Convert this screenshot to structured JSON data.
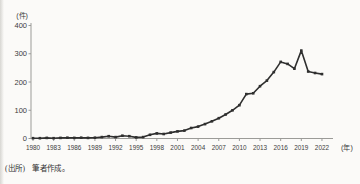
{
  "page": {
    "clipped_title": "■■■■　■■■■■■■■■■■■■■（1980～2022年）",
    "source_note": "(出所)　筆者作成。"
  },
  "chart_data": {
    "type": "line",
    "title": "",
    "xlabel": "(年)",
    "ylabel": "(件)",
    "x_start": 1980,
    "x_end": 2022,
    "x": [
      1980,
      1981,
      1982,
      1983,
      1984,
      1985,
      1986,
      1987,
      1988,
      1989,
      1990,
      1991,
      1992,
      1993,
      1994,
      1995,
      1996,
      1997,
      1998,
      1999,
      2000,
      2001,
      2002,
      2003,
      2004,
      2005,
      2006,
      2007,
      2008,
      2009,
      2010,
      2011,
      2012,
      2013,
      2014,
      2015,
      2016,
      2017,
      2018,
      2019,
      2020,
      2021,
      2022
    ],
    "values": [
      1,
      1,
      2,
      1,
      2,
      3,
      2,
      3,
      2,
      3,
      5,
      8,
      5,
      10,
      8,
      4,
      5,
      13,
      18,
      16,
      21,
      25,
      28,
      37,
      42,
      51,
      61,
      72,
      85,
      100,
      118,
      157,
      160,
      185,
      205,
      235,
      271,
      264,
      247,
      311,
      237,
      232,
      228
    ],
    "x_tick_labels": [
      "1980",
      "1983",
      "1986",
      "1989",
      "1992",
      "1995",
      "1998",
      "2001",
      "2004",
      "2007",
      "2010",
      "2013",
      "2016",
      "2019",
      "2022"
    ],
    "x_tick_step": 3,
    "y_ticks": [
      0,
      100,
      200,
      300,
      400
    ],
    "ylim": [
      0,
      400
    ],
    "grid": false,
    "legend": false,
    "line_color": "#2f2f2f",
    "marker": "square",
    "axis_color": "#9b9b98"
  }
}
